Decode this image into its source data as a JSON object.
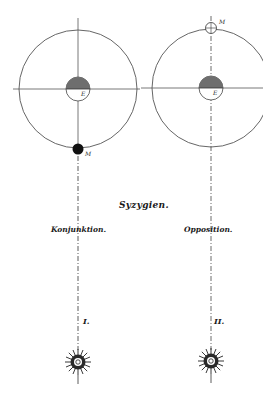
{
  "title": "Syzygien.",
  "panels": [
    {
      "label": "Konjunktion.",
      "numeral": "I.",
      "earth_label": "E",
      "moon_label": "M",
      "moon_position": "between earth and sun (new moon, filled)"
    },
    {
      "label": "Opposition.",
      "numeral": "II.",
      "earth_label": "E",
      "moon_label": "M",
      "moon_position": "opposite side of earth from sun (full moon, open)"
    }
  ],
  "sun_symbol": "sun-icon",
  "colors": {
    "ink": "#1a1a1a",
    "orbit": "#555555",
    "shade": "#6e6e6e",
    "background": "#ffffff"
  }
}
